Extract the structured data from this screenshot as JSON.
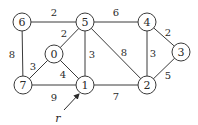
{
  "graph": {
    "nodes": [
      {
        "id": "6",
        "label": "6",
        "x": 22,
        "y": 22
      },
      {
        "id": "5",
        "label": "5",
        "x": 85,
        "y": 22
      },
      {
        "id": "4",
        "label": "4",
        "x": 147,
        "y": 22
      },
      {
        "id": "3",
        "label": "3",
        "x": 181,
        "y": 52
      },
      {
        "id": "0",
        "label": "0",
        "x": 54,
        "y": 54
      },
      {
        "id": "7",
        "label": "7",
        "x": 23,
        "y": 85
      },
      {
        "id": "1",
        "label": "1",
        "x": 85,
        "y": 85
      },
      {
        "id": "2",
        "label": "2",
        "x": 147,
        "y": 85
      }
    ],
    "edges": [
      {
        "from": "6",
        "to": "5",
        "weight": "2",
        "lx": 54,
        "ly": 12
      },
      {
        "from": "5",
        "to": "4",
        "weight": "6",
        "lx": 116,
        "ly": 12
      },
      {
        "from": "6",
        "to": "7",
        "weight": "8",
        "lx": 12,
        "ly": 54
      },
      {
        "from": "5",
        "to": "0",
        "weight": "2",
        "lx": 64,
        "ly": 33
      },
      {
        "from": "5",
        "to": "1",
        "weight": "3",
        "lx": 92,
        "ly": 54
      },
      {
        "from": "5",
        "to": "2",
        "weight": "8",
        "lx": 124,
        "ly": 52
      },
      {
        "from": "4",
        "to": "2",
        "weight": "3",
        "lx": 153,
        "ly": 53
      },
      {
        "from": "4",
        "to": "3",
        "weight": "2",
        "lx": 168,
        "ly": 32
      },
      {
        "from": "3",
        "to": "2",
        "weight": "5",
        "lx": 168,
        "ly": 75
      },
      {
        "from": "0",
        "to": "7",
        "weight": "3",
        "lx": 33,
        "ly": 66
      },
      {
        "from": "0",
        "to": "1",
        "weight": "4",
        "lx": 63,
        "ly": 74
      },
      {
        "from": "7",
        "to": "1",
        "weight": "9",
        "lx": 54,
        "ly": 97
      },
      {
        "from": "1",
        "to": "2",
        "weight": "7",
        "lx": 116,
        "ly": 96
      }
    ],
    "root": {
      "label": "r",
      "node": "1",
      "x": 58,
      "y": 118,
      "arrow_from": [
        64,
        110
      ],
      "arrow_to": [
        79,
        94
      ]
    }
  }
}
